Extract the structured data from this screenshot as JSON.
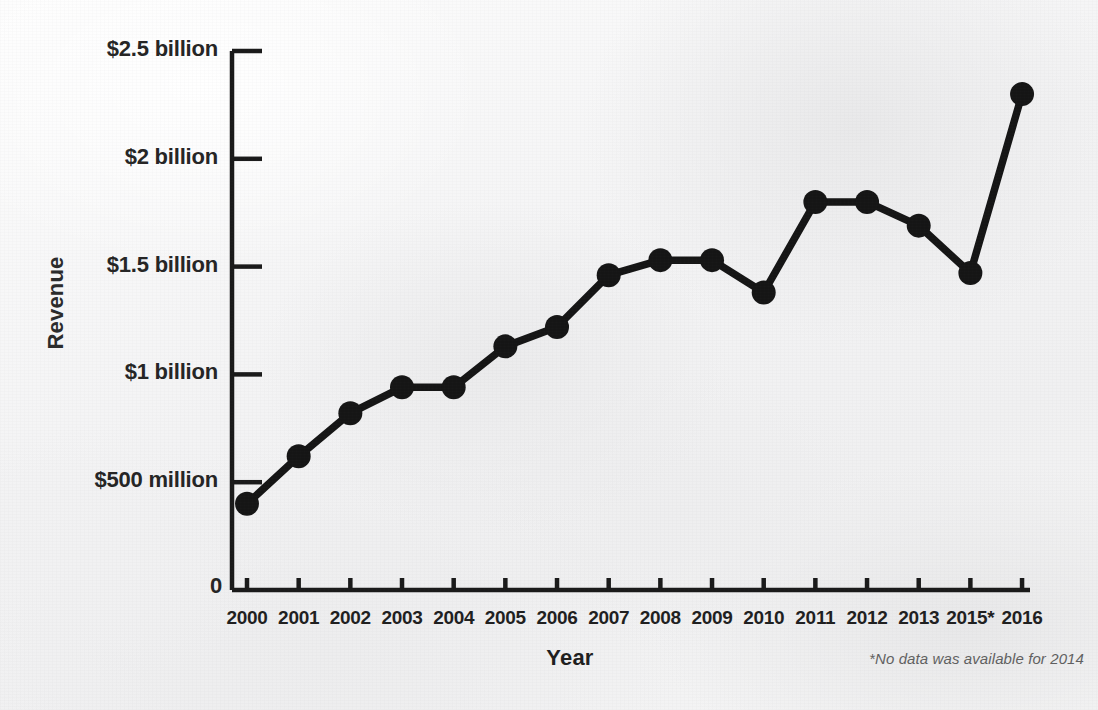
{
  "chart_data": {
    "type": "line",
    "title": "",
    "xlabel": "Year",
    "ylabel": "Revenue",
    "categories": [
      "2000",
      "2001",
      "2002",
      "2003",
      "2004",
      "2005",
      "2006",
      "2007",
      "2008",
      "2009",
      "2010",
      "2011",
      "2012",
      "2013",
      "2015*",
      "2016"
    ],
    "values": [
      0.4,
      0.62,
      0.82,
      0.94,
      0.94,
      1.13,
      1.22,
      1.46,
      1.53,
      1.53,
      1.38,
      1.8,
      1.8,
      1.69,
      1.47,
      2.3
    ],
    "value_units": "billion USD",
    "ylim": [
      0,
      2.5
    ],
    "ytick_values": [
      0,
      0.5,
      1,
      1.5,
      2,
      2.5
    ],
    "ytick_labels": [
      "0",
      "$500 million",
      "$1 billion",
      "$1.5 billion",
      "$2 billion",
      "$2.5 billion"
    ],
    "grid": false,
    "legend": false,
    "annotations": [
      "*No data was available for 2014"
    ],
    "series": [
      {
        "name": "Revenue",
        "values": [
          0.4,
          0.62,
          0.82,
          0.94,
          0.94,
          1.13,
          1.22,
          1.46,
          1.53,
          1.53,
          1.38,
          1.8,
          1.8,
          1.69,
          1.47,
          2.3
        ]
      }
    ]
  },
  "chart": {
    "y_axis_title": "Revenue",
    "x_axis_title": "Year",
    "footnote": "*No data was available for 2014",
    "zero_label": "0",
    "line_color": "#151515",
    "marker_color": "#151515",
    "axis_color": "#1a1a1a",
    "background_color": "#f2f2f2"
  }
}
